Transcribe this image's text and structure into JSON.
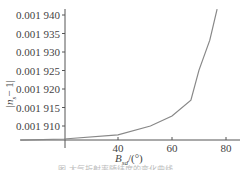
{
  "chart_data": {
    "type": "line",
    "title": "",
    "xlabel": "B_sd/(°)",
    "xlabel_main": "B",
    "xlabel_sub": "sd",
    "xlabel_unit": "/(°)",
    "ylabel": "|n_s - 1|",
    "ylabel_main": "|n",
    "ylabel_sub": "s",
    "ylabel_tail": "− 1|",
    "x_ticks": [
      40,
      60,
      80
    ],
    "y_ticks": [
      "0.001 910",
      "0.001 915",
      "0.001 920",
      "0.001 925",
      "0.001 930",
      "0.001 935",
      "0.001 940"
    ],
    "y_tick_values": [
      0.00191,
      0.001915,
      0.00192,
      0.001925,
      0.00193,
      0.001935,
      0.00194
    ],
    "xlim": [
      4,
      85
    ],
    "ylim": [
      0.001906,
      0.001942
    ],
    "grid": false,
    "legend": null,
    "series": [
      {
        "name": "|n_s - 1|",
        "color": "#888888",
        "x": [
          4,
          20,
          40,
          52,
          60,
          67,
          70,
          74,
          76.7
        ],
        "y": [
          0.0019062,
          0.0019065,
          0.0019076,
          0.00191,
          0.0019127,
          0.001917,
          0.0019251,
          0.0019332,
          0.0019416
        ]
      }
    ]
  },
  "caption": {
    "text": "图 大气折射率随纬度的变化曲线"
  }
}
